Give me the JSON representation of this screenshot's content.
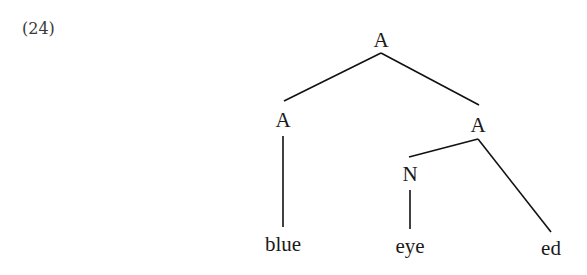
{
  "example": {
    "number": "(24)"
  },
  "tree": {
    "nodes": {
      "root": {
        "label": "A"
      },
      "left": {
        "label": "A"
      },
      "right": {
        "label": "A"
      },
      "noun": {
        "label": "N"
      }
    },
    "leaves": {
      "blue": {
        "label": "blue"
      },
      "eye": {
        "label": "eye"
      },
      "ed": {
        "label": "ed"
      }
    },
    "structure": "[A [A blue] [A [N eye] ed]]"
  }
}
